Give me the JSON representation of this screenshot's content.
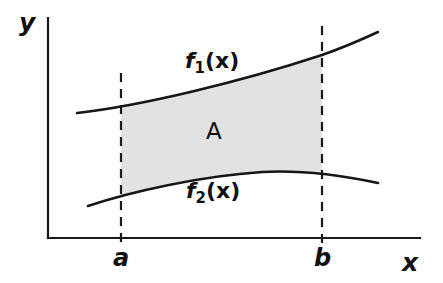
{
  "figure": {
    "kind": "math-diagram",
    "title_visible": false,
    "background_color": "#ffffff",
    "ink_color": "#1a1a1a",
    "shade_color": "#e2e2e2",
    "width": 443,
    "height": 283
  },
  "axes": {
    "y_label": "y",
    "x_label": "x",
    "origin_x": 48,
    "origin_y": 238,
    "x_axis_end": 420,
    "y_axis_top": 18
  },
  "ticks": [
    {
      "label": "a",
      "x": 121
    },
    {
      "label": "b",
      "x": 322
    }
  ],
  "curves": {
    "upper": {
      "label_base": "f",
      "label_sub": "1",
      "label_arg": "(x)",
      "label_full": "f1(x)",
      "description": "increasing convex curve",
      "path": "M 77 113 C 140 106, 240 82, 322 55 C 345 47, 365 38, 378 32"
    },
    "lower": {
      "label_base": "f",
      "label_sub": "2",
      "label_arg": "(x)",
      "label_full": "f2(x)",
      "description": "concave curve rising then gently falling",
      "path": "M 88 206 C 130 192, 200 176, 262 172 C 300 170, 345 176, 378 183"
    }
  },
  "region": {
    "label": "A",
    "x_from": 121,
    "x_to": 322,
    "fill": "#e2e2e2",
    "path": "M 121 108 C 160 99, 245 78, 322 55 L 322 172 C 295 170, 200 176, 152 187 C 138 190, 128 193, 121 196 Z"
  },
  "dashed_lines": [
    {
      "name": "dashed-line-a",
      "x": 121,
      "y_top": 73,
      "y_bottom": 246
    },
    {
      "name": "dashed-line-b",
      "x": 322,
      "y_top": 26,
      "y_bottom": 246
    }
  ]
}
